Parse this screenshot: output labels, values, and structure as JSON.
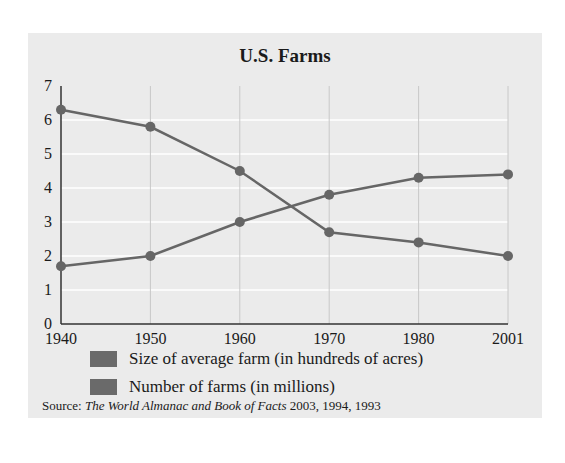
{
  "chart_data": {
    "type": "line",
    "title": "U.S. Farms",
    "xlabel": "",
    "ylabel": "",
    "categories": [
      "1940",
      "1950",
      "1960",
      "1970",
      "1980",
      "2001"
    ],
    "yticks": [
      0,
      1,
      2,
      3,
      4,
      5,
      6,
      7
    ],
    "ylim": [
      0,
      7
    ],
    "grid": true,
    "legend_position": "bottom",
    "series": [
      {
        "name": "Size of average farm (in hundreds of acres)",
        "values": [
          1.7,
          2.0,
          3.0,
          3.8,
          4.3,
          4.4
        ]
      },
      {
        "name": "Number of farms (in millions)",
        "values": [
          6.3,
          5.8,
          4.5,
          2.7,
          2.4,
          2.0
        ]
      }
    ],
    "line_color": "#666666",
    "marker_color": "#666666"
  },
  "source": {
    "prefix": "Source: ",
    "title": "The World Almanac and Book of Facts",
    "years": " 2003, 1994, 1993"
  }
}
